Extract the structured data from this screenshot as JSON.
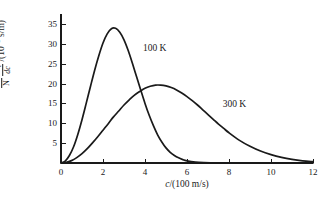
{
  "chart_data": {
    "type": "line",
    "title": "",
    "xlabel": "c/(100 m/s)",
    "ylabel": "(1/N)(dn_c/dc)/(10^-3 s/m)",
    "xlim": [
      0,
      12
    ],
    "ylim": [
      0,
      37.5
    ],
    "grid": false,
    "legend_position": "inline-annotation",
    "xticks": [
      "0",
      "2",
      "4",
      "6",
      "8",
      "10",
      "12"
    ],
    "xtick_values": [
      0,
      2,
      4,
      6,
      8,
      10,
      12
    ],
    "yticks": [
      "5",
      "10",
      "15",
      "20",
      "25",
      "30",
      "35"
    ],
    "ytick_values": [
      5,
      10,
      15,
      20,
      25,
      30,
      35
    ],
    "annotations": [
      {
        "text": "100 K",
        "x": 3.9,
        "y": 30.0
      },
      {
        "text": "300 K",
        "x": 7.7,
        "y": 15.8
      }
    ],
    "series": [
      {
        "name": "100 K",
        "peak_x": 2.3,
        "peak_y": 33.8,
        "x": [
          0,
          0.2,
          0.4,
          0.6,
          0.8,
          1.0,
          1.2,
          1.4,
          1.6,
          1.8,
          2.0,
          2.2,
          2.4,
          2.6,
          2.8,
          3.0,
          3.2,
          3.4,
          3.6,
          3.8,
          4.0,
          4.2,
          4.4,
          4.6,
          4.8,
          5.0,
          5.2,
          5.4,
          5.6,
          5.8,
          6.0,
          6.4,
          6.8,
          7.2,
          7.6,
          8.0,
          8.6,
          9.2,
          10.0,
          11.0,
          12.0
        ],
        "values": [
          0,
          0.5,
          1.9,
          4.1,
          7.2,
          10.9,
          15.0,
          19.2,
          23.3,
          27.0,
          30.2,
          32.5,
          33.8,
          33.9,
          32.9,
          31.0,
          28.3,
          25.1,
          21.7,
          18.3,
          15.0,
          12.0,
          9.4,
          7.1,
          5.3,
          3.8,
          2.7,
          1.9,
          1.3,
          0.85,
          0.55,
          0.22,
          0.08,
          0.03,
          0.01,
          0.004,
          0.001,
          0,
          0,
          0,
          0
        ]
      },
      {
        "name": "300 K",
        "peak_x": 4.1,
        "peak_y": 19.6,
        "x": [
          0,
          0.25,
          0.5,
          0.75,
          1.0,
          1.25,
          1.5,
          1.75,
          2.0,
          2.25,
          2.5,
          2.75,
          3.0,
          3.25,
          3.5,
          3.75,
          4.0,
          4.25,
          4.5,
          4.75,
          5.0,
          5.25,
          5.5,
          5.75,
          6.0,
          6.25,
          6.5,
          6.75,
          7.0,
          7.25,
          7.5,
          7.75,
          8.0,
          8.5,
          9.0,
          9.5,
          10.0,
          10.5,
          11.0,
          11.5,
          12.0
        ],
        "values": [
          0,
          0.15,
          0.6,
          1.35,
          2.35,
          3.6,
          5.05,
          6.6,
          8.25,
          9.9,
          11.6,
          13.1,
          14.6,
          15.9,
          17.1,
          18.0,
          18.8,
          19.3,
          19.6,
          19.6,
          19.4,
          19.0,
          18.4,
          17.6,
          16.7,
          15.7,
          14.6,
          13.4,
          12.2,
          11.0,
          9.8,
          8.7,
          7.6,
          5.7,
          4.2,
          3.0,
          2.1,
          1.4,
          0.9,
          0.55,
          0.35
        ]
      }
    ]
  },
  "axis_title": {
    "x": "c/(100 m/s)",
    "y_num": "dn",
    "y_num_sub": "c",
    "y_den": "dc",
    "y_prefix_num": "1",
    "y_prefix_den": "N",
    "y_unit_open": "/(10",
    "y_unit_exp": "−3",
    "y_unit_close": " s/m)"
  },
  "colors": {
    "curve": "#1a1a1a",
    "axis": "#1a1a1a",
    "background": "#ffffff"
  }
}
